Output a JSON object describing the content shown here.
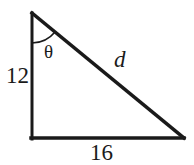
{
  "figure": {
    "kind": "right-triangle-diagram",
    "background_color": "#ffffff",
    "stroke_color": "#1a1a1a",
    "text_color": "#1a1a1a",
    "stroke_width": 3
  },
  "geometry": {
    "apex": {
      "x": 32,
      "y": 13
    },
    "right_angle_corner": {
      "x": 32,
      "y": 139
    },
    "bottom_right": {
      "x": 184,
      "y": 139
    },
    "angle_arc": {
      "radius": 30,
      "at_vertex": "apex"
    }
  },
  "labels": {
    "vertical_leg": "12",
    "horizontal_leg": "16",
    "hypotenuse": "d",
    "angle": "θ"
  }
}
